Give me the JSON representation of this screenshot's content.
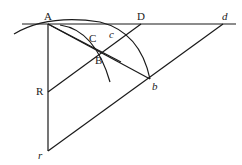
{
  "diagram": {
    "labels": {
      "A": "A",
      "D": "D",
      "d": "d",
      "C": "C",
      "c": "c",
      "B": "B",
      "R": "R",
      "b": "b",
      "r": "r"
    },
    "points": {
      "A": [
        48,
        24
      ],
      "D": [
        141,
        24
      ],
      "d": [
        223,
        24
      ],
      "C": [
        93,
        44
      ],
      "c": [
        111,
        40
      ],
      "B": [
        101,
        53
      ],
      "R": [
        48,
        92
      ],
      "b": [
        150,
        79
      ],
      "r": [
        48,
        151
      ]
    },
    "line_color": "#1a1a1a"
  }
}
